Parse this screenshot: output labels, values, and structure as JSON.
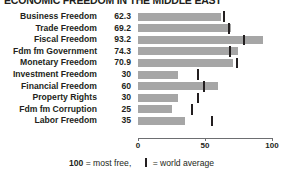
{
  "title": "ECONOMIC FREEDOM IN THE MIDDLE EAST",
  "legend": {
    "scale_value": "100",
    "scale_text": " = most free,",
    "tick_text": " = world average",
    "tick_icon": "vertical-bar-icon"
  },
  "chart_data": {
    "type": "bar",
    "title": "ECONOMIC FREEDOM IN THE MIDDLE EAST",
    "xlabel": "",
    "ylabel": "",
    "xlim": [
      0,
      100
    ],
    "orientation": "horizontal",
    "grid": false,
    "legend_position": "bottom",
    "tick_labels": [
      "0",
      "50",
      "100"
    ],
    "ticks": [
      0,
      50,
      100
    ],
    "categories": [
      "Business Freedom",
      "Trade Freedom",
      "Fiscal Freedom",
      "Fdm fm Government",
      "Monetary Freedom",
      "Investment Freedom",
      "Financial Freedom",
      "Property Rights",
      "Fdm fm Corruption",
      "Labor Freedom"
    ],
    "values": [
      62.3,
      69.2,
      93.2,
      74.3,
      70.9,
      30,
      60,
      30,
      25,
      35
    ],
    "value_labels": [
      "62.3",
      "69.2",
      "93.2",
      "74.3",
      "70.9",
      "30",
      "60",
      "30",
      "25",
      "35"
    ],
    "series": [
      {
        "name": "Country score",
        "values": [
          62.3,
          69.2,
          93.2,
          74.3,
          70.9,
          30,
          60,
          30,
          25,
          35
        ]
      },
      {
        "name": "World average",
        "marker": "tick",
        "values": [
          64,
          68,
          79,
          69,
          74,
          45,
          49,
          45,
          40,
          55
        ]
      }
    ],
    "colors": {
      "bar": "#a6a6a6",
      "world_average_tick": "#231f20",
      "axis": "#6d6e71",
      "text": "#231f20",
      "background": "#ffffff"
    }
  }
}
